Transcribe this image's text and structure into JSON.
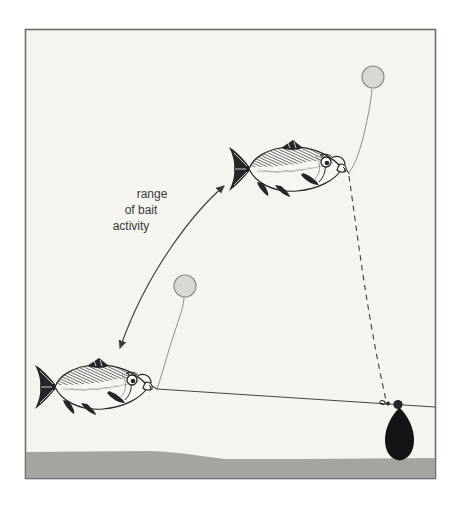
{
  "figure": {
    "type": "fishing-rig-diagram",
    "label": {
      "lines": [
        "range",
        "of bait",
        "activity"
      ]
    },
    "parts": [
      "buoyant-bait-upper",
      "buoyant-bait-lower",
      "fish-upper",
      "fish-lower",
      "range-of-bait-activity-arrow",
      "hook-link-dashed",
      "main-line",
      "swivel",
      "bead",
      "lead-weight",
      "lakebed-ground",
      "picture-frame"
    ]
  },
  "colors": {
    "page_background": "#ffffff",
    "paper": "#f5f4ef",
    "frame_border": "#6e6e6e",
    "ground": "#a5a4a0",
    "bait_fill": "#d9d8d3",
    "bait_stroke": "#8f8f8a",
    "line": "#3d3d3b",
    "rig_line": "#44433f",
    "arrow": "#3c3c3c",
    "label_text": "#3a3a3a",
    "lead": "#141414",
    "ink": "#262626",
    "fish_body": "#f7f6f2"
  }
}
